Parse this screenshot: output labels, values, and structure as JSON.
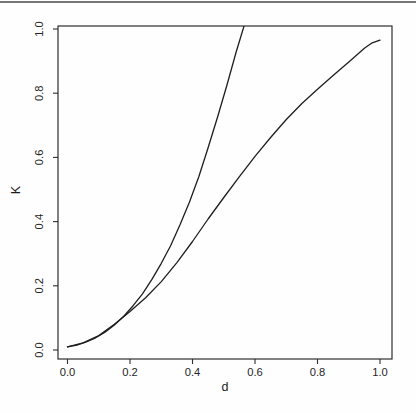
{
  "page": {
    "background": "#fefefe",
    "top_border_color": "#777777"
  },
  "chart_data": {
    "type": "line",
    "title": "",
    "xlabel": "d",
    "ylabel": "K",
    "xlim": [
      0,
      1
    ],
    "ylim": [
      0,
      1
    ],
    "x_axis_expansion": 0.04,
    "grid": false,
    "frame": "box",
    "legend": "none",
    "line_color": "#1e1e1e",
    "frame_color": "#2e2e2e",
    "xticks": [
      0.0,
      0.2,
      0.4,
      0.6,
      0.8,
      1.0
    ],
    "yticks": [
      0.0,
      0.2,
      0.4,
      0.6,
      0.8,
      1.0
    ],
    "xtick_labels": [
      "0.0",
      "0.2",
      "0.4",
      "0.6",
      "0.8",
      "1.0"
    ],
    "ytick_labels": [
      "0.0",
      "0.2",
      "0.4",
      "0.6",
      "0.8",
      "1.0"
    ],
    "series": [
      {
        "name": "curve-1-steep",
        "description": "steep curve, exits top of frame near d=0.565",
        "x": [
          0.0,
          0.03,
          0.06,
          0.09,
          0.12,
          0.15,
          0.18,
          0.21,
          0.24,
          0.27,
          0.3,
          0.33,
          0.36,
          0.39,
          0.42,
          0.45,
          0.48,
          0.51,
          0.54,
          0.565
        ],
        "y": [
          0.01,
          0.015,
          0.025,
          0.038,
          0.055,
          0.078,
          0.105,
          0.138,
          0.175,
          0.22,
          0.27,
          0.325,
          0.39,
          0.46,
          0.54,
          0.63,
          0.725,
          0.825,
          0.93,
          1.01
        ]
      },
      {
        "name": "curve-2-gradual",
        "description": "gradual curve, flattens to K=0.965 at d=1.0",
        "x": [
          0.0,
          0.05,
          0.1,
          0.15,
          0.2,
          0.25,
          0.3,
          0.35,
          0.4,
          0.45,
          0.5,
          0.55,
          0.6,
          0.65,
          0.7,
          0.75,
          0.8,
          0.85,
          0.9,
          0.95,
          0.975,
          1.0
        ],
        "y": [
          0.01,
          0.022,
          0.045,
          0.08,
          0.12,
          0.163,
          0.213,
          0.272,
          0.338,
          0.408,
          0.475,
          0.54,
          0.603,
          0.662,
          0.718,
          0.768,
          0.812,
          0.855,
          0.897,
          0.94,
          0.957,
          0.965
        ]
      }
    ]
  }
}
